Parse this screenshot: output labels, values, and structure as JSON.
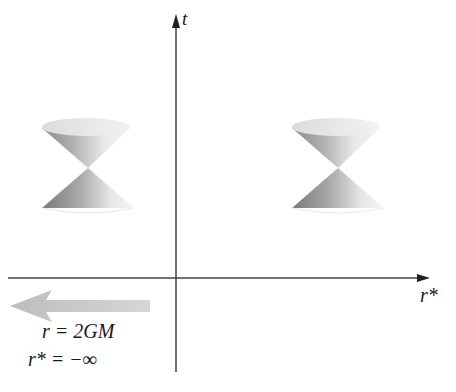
{
  "diagram": {
    "title": "",
    "axes": {
      "vertical_label": "t",
      "horizontal_label": "r*"
    },
    "annotations": {
      "horizon_line1": "r = 2GM",
      "horizon_line2": "r* = −∞",
      "arrow_direction": "left"
    },
    "light_cones": [
      {
        "name": "left-light-cone",
        "position": "left"
      },
      {
        "name": "right-light-cone",
        "position": "right"
      }
    ],
    "colors": {
      "axis": "#333333",
      "arrow_fill": "#c8c8c8",
      "cone_dark": "#7a7a7a",
      "cone_light": "#f0f0f0"
    }
  }
}
